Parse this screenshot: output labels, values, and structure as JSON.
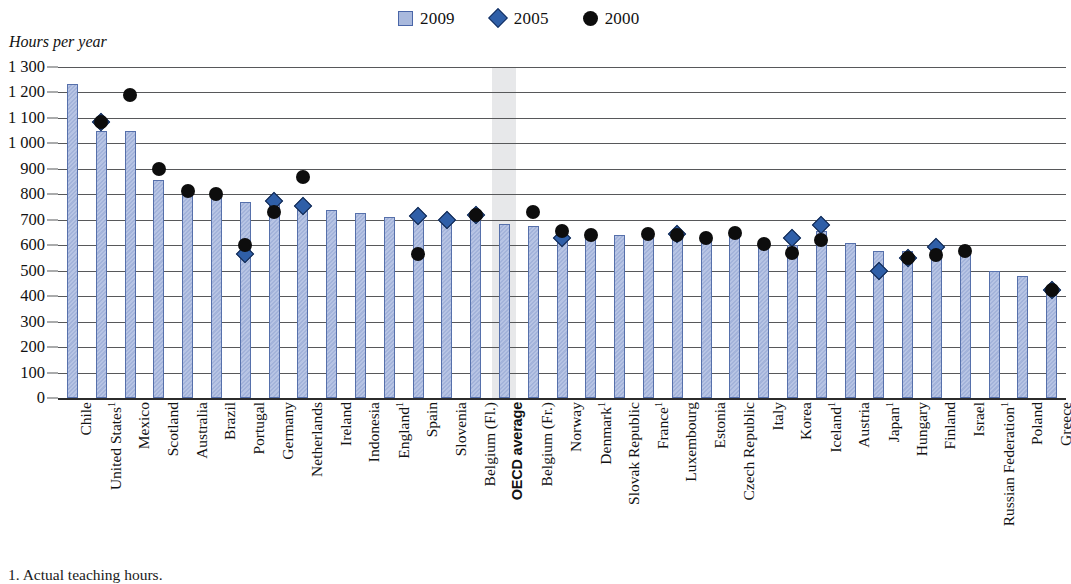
{
  "axis_title": "Hours per year",
  "footnote": "1. Actual teaching hours.",
  "legend": {
    "items": [
      {
        "label": "2009",
        "marker": "square-swatch-icon",
        "color": "#a9b9dd"
      },
      {
        "label": "2005",
        "marker": "diamond-marker-icon",
        "color": "#2f5fa8"
      },
      {
        "label": "2000",
        "marker": "circle-marker-icon",
        "color": "#0d0d0d"
      }
    ]
  },
  "highlight": {
    "category": "OECD average",
    "band_color": "#e3e4e6"
  },
  "chart_data": {
    "type": "bar",
    "title": "",
    "subtitle": "",
    "xlabel": "",
    "ylabel": "Hours per year",
    "ylim": [
      0,
      1300
    ],
    "ytick_step": 100,
    "yticks": [
      "1 300",
      "1 200",
      "1 100",
      "1 000",
      "900",
      "800",
      "700",
      "600",
      "500",
      "400",
      "300",
      "200",
      "100",
      "0"
    ],
    "ytick_values": [
      1300,
      1200,
      1100,
      1000,
      900,
      800,
      700,
      600,
      500,
      400,
      300,
      200,
      100,
      0
    ],
    "grid": true,
    "legend_position": "top-center",
    "categories": [
      "Chile",
      "United States¹",
      "Mexico",
      "Scotland",
      "Australia",
      "Brazil",
      "Portugal",
      "Germany",
      "Netherlands",
      "Ireland",
      "Indonesia",
      "England¹",
      "Spain",
      "Slovenia",
      "Belgium (Fl.)",
      "OECD average",
      "Belgium (Fr.)",
      "Norway",
      "Denmark¹",
      "Slovak Republic",
      "France¹",
      "Luxembourg",
      "Estonia",
      "Czech Republic",
      "Italy",
      "Korea",
      "Iceland¹",
      "Austria",
      "Japan¹",
      "Hungary",
      "Finland",
      "Israel",
      "Russian Federation¹",
      "Poland",
      "Greece"
    ],
    "footnote_markers": [
      "United States¹",
      "England¹",
      "Denmark¹",
      "France¹",
      "Iceland¹",
      "Japan¹",
      "Russian Federation¹"
    ],
    "series": [
      {
        "name": "2009",
        "type": "bar",
        "color": "#a9b9dd",
        "values": [
          1235,
          1050,
          1047,
          855,
          803,
          800,
          770,
          758,
          750,
          740,
          725,
          712,
          715,
          700,
          718,
          685,
          675,
          640,
          640,
          640,
          630,
          640,
          630,
          645,
          605,
          600,
          655,
          607,
          577,
          579,
          595,
          577,
          500,
          480,
          420
        ]
      },
      {
        "name": "2005",
        "type": "scatter",
        "marker": "diamond",
        "color": "#2f5fa8",
        "values": [
          null,
          1085,
          null,
          null,
          null,
          null,
          565,
          775,
          755,
          null,
          null,
          null,
          715,
          700,
          718,
          null,
          null,
          628,
          null,
          null,
          null,
          645,
          null,
          null,
          null,
          628,
          680,
          null,
          500,
          550,
          595,
          null,
          null,
          null,
          425
        ]
      },
      {
        "name": "2000",
        "type": "scatter",
        "marker": "circle",
        "color": "#0d0d0d",
        "values": [
          null,
          1085,
          1190,
          900,
          815,
          803,
          600,
          732,
          868,
          null,
          null,
          null,
          565,
          null,
          720,
          null,
          730,
          655,
          640,
          null,
          645,
          640,
          628,
          650,
          605,
          570,
          622,
          null,
          null,
          548,
          563,
          578,
          null,
          null,
          425
        ]
      }
    ]
  }
}
